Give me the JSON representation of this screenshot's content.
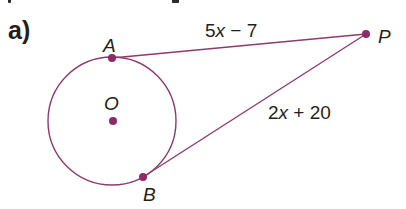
{
  "problem": {
    "part_label": "a)"
  },
  "diagram": {
    "colors": {
      "stroke": "#8e3a6e",
      "point": "#8e2a66",
      "text": "#231f20"
    },
    "circle": {
      "center_label": "O",
      "cx": 112,
      "cy": 121,
      "r": 64
    },
    "points": {
      "A": {
        "label": "A",
        "x": 112,
        "y": 58
      },
      "O": {
        "label": "O",
        "x": 113,
        "y": 121
      },
      "B": {
        "label": "B",
        "x": 143,
        "y": 177
      },
      "P": {
        "label": "P",
        "x": 366,
        "y": 34
      }
    },
    "segments": {
      "AP": {
        "label_num": "5",
        "label_var": "x",
        "label_rest": " − 7"
      },
      "BP": {
        "label_num": "2",
        "label_var": "x",
        "label_rest": " + 20"
      }
    }
  }
}
